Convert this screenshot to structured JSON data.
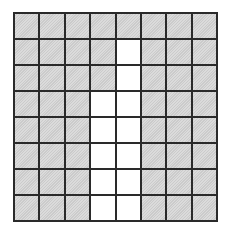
{
  "figure": {
    "type": "area-model-grid",
    "rows": 8,
    "columns": 8,
    "colors": {
      "shaded": "#d3d3d3",
      "empty": "#ffffff",
      "line": "#2a2a2a"
    },
    "cells": [
      [
        1,
        1,
        1,
        1,
        1,
        1,
        1,
        1
      ],
      [
        1,
        1,
        1,
        1,
        0,
        1,
        1,
        1
      ],
      [
        1,
        1,
        1,
        1,
        0,
        1,
        1,
        1
      ],
      [
        1,
        1,
        1,
        0,
        0,
        1,
        1,
        1
      ],
      [
        1,
        1,
        1,
        0,
        0,
        1,
        1,
        1
      ],
      [
        1,
        1,
        1,
        0,
        0,
        1,
        1,
        1
      ],
      [
        1,
        1,
        1,
        0,
        0,
        1,
        1,
        1
      ],
      [
        1,
        1,
        1,
        0,
        0,
        1,
        1,
        1
      ]
    ],
    "shaded_count": 52,
    "total_count": 64
  }
}
